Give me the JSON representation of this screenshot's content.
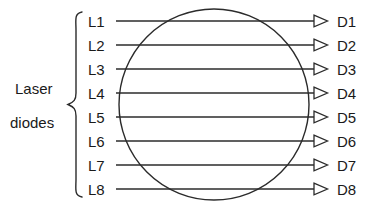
{
  "figure": {
    "group_label_line1": "Laser",
    "group_label_line2": "diodes",
    "caption": "",
    "colors": {
      "stroke": "#2b2b2b",
      "text": "#1a1a1a",
      "background": "#ffffff"
    },
    "sources": [
      {
        "label": "L1"
      },
      {
        "label": "L2"
      },
      {
        "label": "L3"
      },
      {
        "label": "L4"
      },
      {
        "label": "L5"
      },
      {
        "label": "L6"
      },
      {
        "label": "L7"
      },
      {
        "label": "L8"
      }
    ],
    "detectors": [
      {
        "label": "D1"
      },
      {
        "label": "D2"
      },
      {
        "label": "D3"
      },
      {
        "label": "D4"
      },
      {
        "label": "D5"
      },
      {
        "label": "D6"
      },
      {
        "label": "D7"
      },
      {
        "label": "D8"
      }
    ],
    "lens": {
      "shape": "ellipse",
      "center_x": 214,
      "center_y": 104,
      "radius_x": 95,
      "radius_y": 95
    },
    "beam_geometry": {
      "count": 8,
      "first_y": 21,
      "spacing_y": 24,
      "start_x": 116,
      "end_x": 313,
      "arrow_tip_x": 328
    },
    "brace": {
      "top_y": 12,
      "bottom_y": 196,
      "right_x": 82,
      "tip_x": 68,
      "tip_y": 104
    }
  }
}
